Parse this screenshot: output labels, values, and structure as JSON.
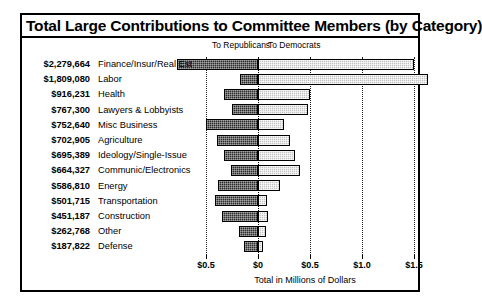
{
  "chart_data": {
    "type": "bar",
    "orientation": "horizontal",
    "subtype": "diverging-stacked",
    "title": "Total Large Contributions to Committee Members (by Category)",
    "xlabel": "Total in Millions of Dollars",
    "ylabel": "",
    "legend_left": "To Republicans",
    "legend_right": "To Democrats",
    "legend_position": "top",
    "grid": true,
    "xlim": [
      -0.62,
      1.62
    ],
    "xticks": [
      -0.5,
      0,
      0.5,
      1.0,
      1.5
    ],
    "xticklabels": [
      "$0.5",
      "$0",
      "$0.5",
      "$1.0",
      "$1.5"
    ],
    "categories": [
      "Finance/Insur/Real Est",
      "Labor",
      "Health",
      "Lawyers & Lobbyists",
      "Misc Business",
      "Agriculture",
      "Ideology/Single-Issue",
      "Communic/Electronics",
      "Energy",
      "Transportation",
      "Construction",
      "Other",
      "Defense"
    ],
    "totals_labels": [
      "$2,279,664",
      "$1,809,080",
      "$916,231",
      "$767,300",
      "$752,640",
      "$702,905",
      "$695,389",
      "$664,327",
      "$586,810",
      "$501,715",
      "$451,187",
      "$262,768",
      "$187,822"
    ],
    "totals": [
      2279664,
      1809080,
      916231,
      767300,
      752640,
      702905,
      695389,
      664327,
      586810,
      501715,
      451187,
      262768,
      187822
    ],
    "series": [
      {
        "name": "To Republicans",
        "color": "#2a2a2a",
        "direction": "left",
        "values": [
          0.78,
          0.175,
          0.33,
          0.25,
          0.5,
          0.39,
          0.33,
          0.26,
          0.38,
          0.41,
          0.35,
          0.18,
          0.13
        ]
      },
      {
        "name": "To Democrats",
        "color": "#c3c3c3",
        "direction": "right",
        "values": [
          1.5,
          1.635,
          0.5,
          0.48,
          0.25,
          0.31,
          0.36,
          0.4,
          0.21,
          0.09,
          0.1,
          0.08,
          0.05
        ]
      }
    ],
    "units": "millions of dollars"
  }
}
